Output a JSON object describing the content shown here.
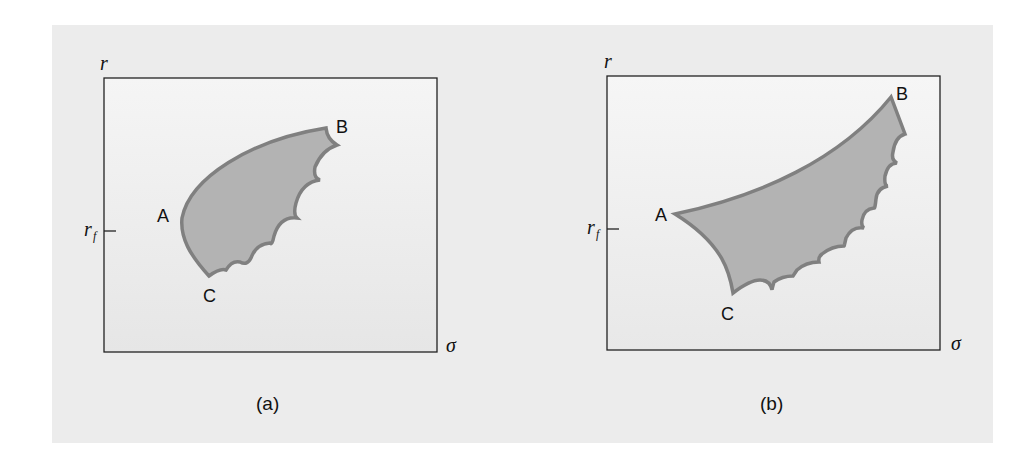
{
  "figure": {
    "panels": [
      {
        "id": "a",
        "caption": "(a)",
        "y_axis_label": "r",
        "x_axis_label": "σ",
        "tick_label_main": "r",
        "tick_label_sub": "f",
        "points": [
          {
            "name": "A",
            "label": "A"
          },
          {
            "name": "B",
            "label": "B"
          },
          {
            "name": "C",
            "label": "C"
          }
        ]
      },
      {
        "id": "b",
        "caption": "(b)",
        "y_axis_label": "r",
        "x_axis_label": "σ",
        "tick_label_main": "r",
        "tick_label_sub": "f",
        "points": [
          {
            "name": "A",
            "label": "A"
          },
          {
            "name": "B",
            "label": "B"
          },
          {
            "name": "C",
            "label": "C"
          }
        ]
      }
    ],
    "colors": {
      "page_background": "#ececec",
      "plot_background": "#f1f1f1",
      "region_fill": "#b3b3b3",
      "region_outline": "#808080",
      "axis_line": "#222222"
    }
  }
}
